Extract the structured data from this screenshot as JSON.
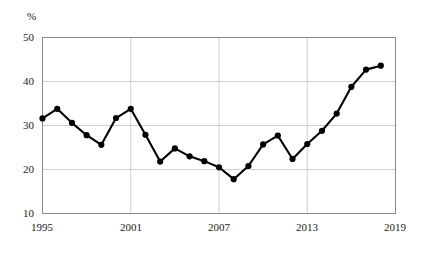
{
  "chart_data": {
    "type": "line",
    "title": "",
    "xlabel": "",
    "ylabel": "%",
    "unit_label": "%",
    "x": [
      1995,
      1996,
      1997,
      1998,
      1999,
      2000,
      2001,
      2002,
      2003,
      2004,
      2005,
      2006,
      2007,
      2008,
      2009,
      2010,
      2011,
      2012,
      2013,
      2014,
      2015,
      2016,
      2017,
      2018
    ],
    "values": [
      31.6,
      33.8,
      30.6,
      27.8,
      25.6,
      31.7,
      33.8,
      27.9,
      21.8,
      24.8,
      23.0,
      21.9,
      20.5,
      17.8,
      20.8,
      25.7,
      27.7,
      22.4,
      25.8,
      28.8,
      32.7,
      38.8,
      42.7,
      43.6
    ],
    "series": [
      {
        "name": "series-1",
        "values": [
          31.6,
          33.8,
          30.6,
          27.8,
          25.6,
          31.7,
          33.8,
          27.9,
          21.8,
          24.8,
          23.0,
          21.9,
          20.5,
          17.8,
          20.8,
          25.7,
          27.7,
          22.4,
          25.8,
          28.8,
          32.7,
          38.8,
          42.7,
          43.6
        ]
      }
    ],
    "xlim": [
      1995,
      2019
    ],
    "ylim": [
      10,
      50
    ],
    "y_ticks": [
      10,
      20,
      30,
      40,
      50
    ],
    "y_tick_labels": [
      "10",
      "20",
      "30",
      "40",
      "50"
    ],
    "x_ticks": [
      1995,
      2001,
      2007,
      2013,
      2019
    ],
    "x_tick_labels": [
      "1995",
      "2001",
      "2007",
      "2013",
      "2019"
    ],
    "grid": true,
    "grid_axes": "both",
    "legend": false,
    "legend_position": "none",
    "marker": "circle",
    "line_color": "#000000",
    "grid_color": "#cfcfcf",
    "frame_color": "#8a8a8a",
    "background_color": "#ffffff"
  }
}
